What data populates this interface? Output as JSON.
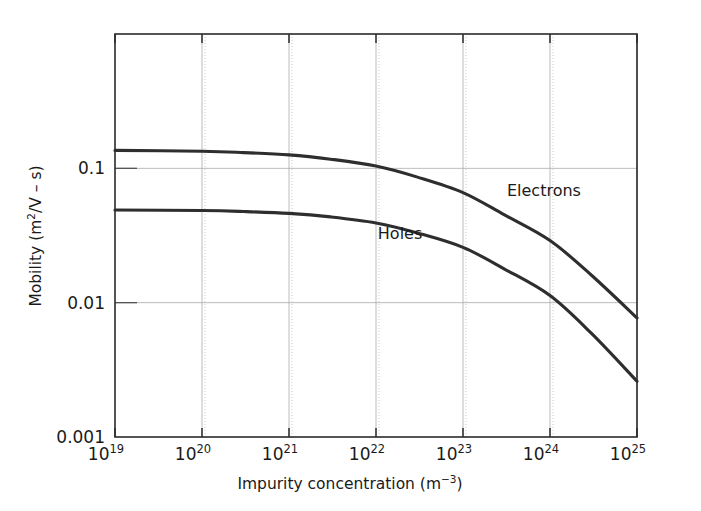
{
  "chart_data": {
    "type": "line",
    "title": "",
    "xlabel": "Impurity concentration (m−3)",
    "xlabel_base": "Impurity concentration (m",
    "xlabel_sup": "−3",
    "xlabel_close": ")",
    "ylabel": "Mobility (m2/V – s)",
    "ylabel_pre": "Mobility (m",
    "ylabel_sup": "2",
    "ylabel_post": "/V – s)",
    "xscale": "log",
    "yscale": "log",
    "xlim": [
      1e+19,
      1e+25
    ],
    "ylim": [
      0.001,
      1.0
    ],
    "grid": true,
    "legend_position": "inline-annotation",
    "x_tick_labels": [
      {
        "base": "10",
        "exp": "19",
        "value": 1e+19
      },
      {
        "base": "10",
        "exp": "20",
        "value": 1e+20
      },
      {
        "base": "10",
        "exp": "21",
        "value": 1e+21
      },
      {
        "base": "10",
        "exp": "22",
        "value": 1e+22
      },
      {
        "base": "10",
        "exp": "23",
        "value": 1e+23
      },
      {
        "base": "10",
        "exp": "24",
        "value": 1e+24
      },
      {
        "base": "10",
        "exp": "25",
        "value": 1e+25
      }
    ],
    "y_tick_labels": [
      {
        "text": "0.1",
        "value": 0.1
      },
      {
        "text": "0.01",
        "value": 0.01
      },
      {
        "text": "0.001",
        "value": 0.001
      }
    ],
    "x": [
      1e+19,
      1e+20,
      3e+20,
      1e+21,
      3e+21,
      1e+22,
      3e+22,
      1e+23,
      3e+23,
      1e+24,
      3e+24,
      1e+25
    ],
    "series": [
      {
        "name": "Electrons",
        "label": "Electrons",
        "annotation_x": 3.2e+23,
        "annotation_y": 0.062,
        "values": [
          0.136,
          0.134,
          0.131,
          0.126,
          0.117,
          0.104,
          0.086,
          0.066,
          0.045,
          0.029,
          0.016,
          0.0077
        ]
      },
      {
        "name": "Holes",
        "label": "Holes",
        "annotation_x": 1.05e+22,
        "annotation_y": 0.03,
        "values": [
          0.049,
          0.0485,
          0.0477,
          0.0462,
          0.0435,
          0.0392,
          0.033,
          0.0258,
          0.0178,
          0.0113,
          0.0059,
          0.0026
        ]
      }
    ]
  },
  "figure": {
    "plot_left_px": 115,
    "plot_right_px": 637,
    "plot_top_px": 34,
    "plot_bottom_px": 437
  }
}
